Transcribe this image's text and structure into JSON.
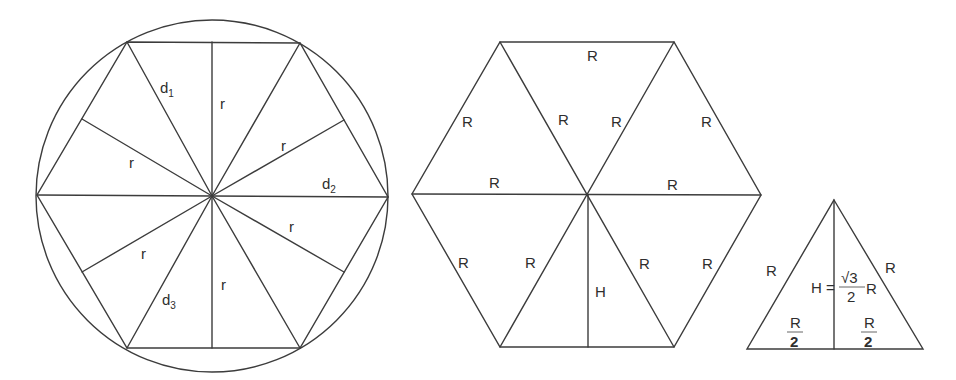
{
  "figure1": {
    "title": "Circle with inscribed hexagon",
    "circle": {
      "cx": 212,
      "cy": 196,
      "r": 176
    },
    "labels": {
      "d1": {
        "base": "d",
        "sub": "1"
      },
      "d2": {
        "base": "d",
        "sub": "2"
      },
      "d3": {
        "base": "d",
        "sub": "3"
      },
      "r": "r"
    }
  },
  "figure2": {
    "title": "Hexagon of six equilateral triangles",
    "side_label": "R",
    "height_label": "H"
  },
  "figure3": {
    "title": "Equilateral triangle height",
    "side_left": "R",
    "side_right": "R",
    "height_prefix": "H =",
    "height_numerator": "√3",
    "height_denominator": "2",
    "height_suffix": "R",
    "half_base_numerator": "R",
    "half_base_denominator": "2"
  }
}
